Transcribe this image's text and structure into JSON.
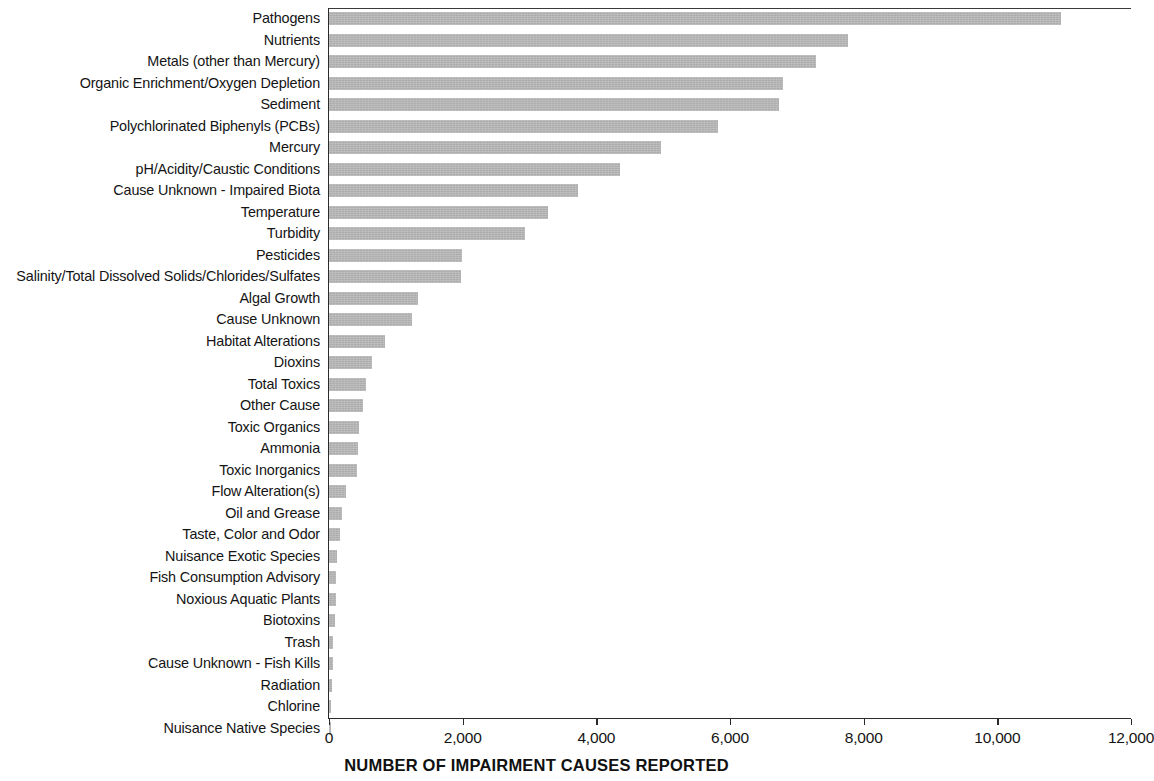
{
  "chart_data": {
    "type": "bar",
    "orientation": "horizontal",
    "title": "",
    "subtitle": "",
    "xlabel": "NUMBER OF IMPAIRMENT CAUSES REPORTED",
    "ylabel": "",
    "xlim": [
      0,
      12000
    ],
    "xticks": [
      0,
      2000,
      4000,
      6000,
      8000,
      10000,
      12000
    ],
    "xtick_labels": [
      "0",
      "2,000",
      "4,000",
      "6,000",
      "8,000",
      "10,000",
      "12,000"
    ],
    "grid": false,
    "legend": null,
    "bar_color": "#adadad",
    "axis_color": "#2b2b2b",
    "categories": [
      "Pathogens",
      "Nutrients",
      "Metals (other than Mercury)",
      "Organic Enrichment/Oxygen Depletion",
      "Sediment",
      "Polychlorinated Biphenyls (PCBs)",
      "Mercury",
      "pH/Acidity/Caustic Conditions",
      "Cause Unknown - Impaired Biota",
      "Temperature",
      "Turbidity",
      "Pesticides",
      "Salinity/Total Dissolved Solids/Chlorides/Sulfates",
      "Algal Growth",
      "Cause Unknown",
      "Habitat Alterations",
      "Dioxins",
      "Total Toxics",
      "Other Cause",
      "Toxic Organics",
      "Ammonia",
      "Toxic Inorganics",
      "Flow Alteration(s)",
      "Oil and Grease",
      "Taste, Color and Odor",
      "Nuisance Exotic Species",
      "Fish Consumption Advisory",
      "Noxious Aquatic Plants",
      "Biotoxins",
      "Trash",
      "Cause Unknown - Fish Kills",
      "Radiation",
      "Chlorine",
      "Nuisance Native Species"
    ],
    "values": [
      10950,
      7770,
      7290,
      6790,
      6730,
      5820,
      4970,
      4350,
      3730,
      3280,
      2930,
      1990,
      1970,
      1330,
      1240,
      840,
      640,
      550,
      510,
      450,
      435,
      420,
      250,
      200,
      160,
      120,
      110,
      100,
      85,
      60,
      60,
      45,
      35,
      20
    ]
  }
}
